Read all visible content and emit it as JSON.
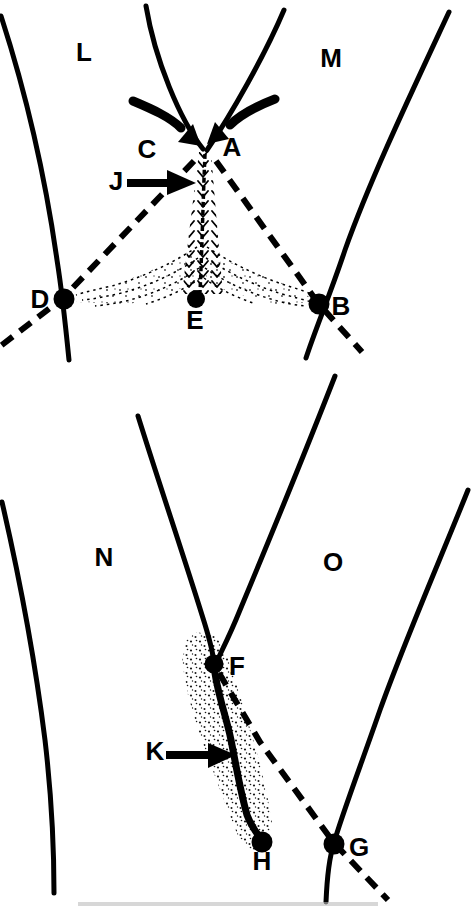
{
  "colors": {
    "ink": "#000000",
    "paper": "#ffffff"
  },
  "top_panel": {
    "plate_left_label": "L",
    "plate_right_label": "M",
    "ridge_left_label": "C",
    "ridge_right_label": "A",
    "feature_arrow_label": "J",
    "junction_left_label": "D",
    "junction_right_label": "B",
    "center_point_label": "E"
  },
  "bottom_panel": {
    "plate_left_label": "N",
    "plate_right_label": "O",
    "junction_top_label": "F",
    "feature_arrow_label": "K",
    "tip_point_label": "H",
    "junction_right_label": "G"
  }
}
